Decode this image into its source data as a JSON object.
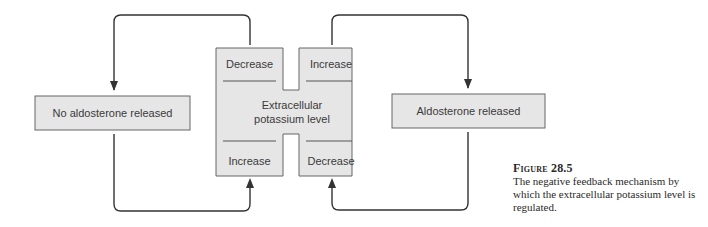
{
  "diagram": {
    "left_box": {
      "label": "No aldosterone released"
    },
    "right_box": {
      "label": "Aldosterone released"
    },
    "center": {
      "label_line1": "Extracellular",
      "label_line2": "potassium level",
      "top_left": "Decrease",
      "top_right": "Increase",
      "bottom_left": "Increase",
      "bottom_right": "Decrease"
    },
    "colors": {
      "box_fill": "#e6e6e6",
      "stroke": "#555555",
      "arrow": "#333333"
    }
  },
  "caption": {
    "title": "Figure 28.5",
    "body": "The negative feedback mechanism by which the extracellular potassium level is regulated."
  }
}
